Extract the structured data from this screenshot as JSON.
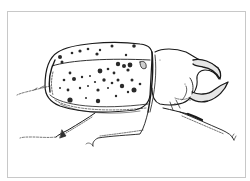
{
  "image": {
    "subject": "spotted rhinoceros beetle",
    "style": "pen-and-ink line illustration",
    "colors": {
      "background": "#ffffff",
      "ink": "#1a1a1a",
      "frame": "#c8c8c8",
      "spot": "#2a2a2a"
    }
  }
}
